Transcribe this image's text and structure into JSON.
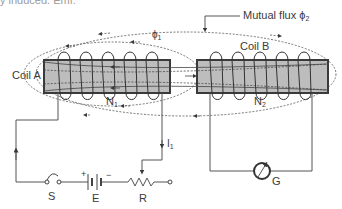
{
  "caption_fragment": "y induced. Emf.",
  "labels": {
    "coil_a": "Coil A",
    "coil_b": "Coil B",
    "mutual_flux": "Mutual flux ϕ",
    "mutual_flux_sub": "2",
    "phi1": "ϕ",
    "phi1_sub": "1",
    "n1": "N",
    "n1_sub": "1",
    "n2": "N",
    "n2_sub": "2",
    "i1": "I",
    "i1_sub": "1",
    "switch": "S",
    "battery": "E",
    "battery_plus": "+",
    "battery_minus": "−",
    "resistor": "R",
    "galvanometer": "G"
  },
  "colors": {
    "core_fill": "#bdbdbd",
    "core_stroke": "#3a3a3a",
    "wire": "#555555",
    "text": "#3a3a3a"
  }
}
